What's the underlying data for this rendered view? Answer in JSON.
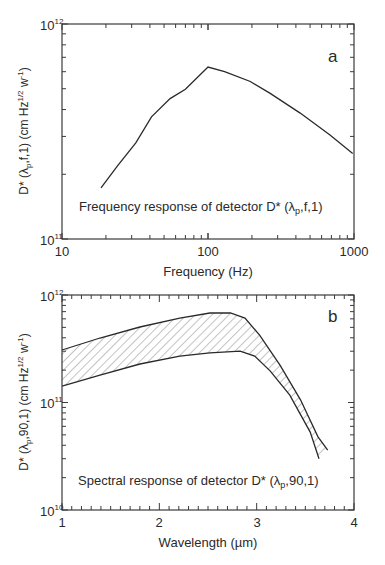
{
  "chart_data": [
    {
      "id": "a",
      "type": "line",
      "panel_label": "a",
      "title": "",
      "annotation": "Frequency response of detector D* (λp,f,1)",
      "annotation_main": "Frequency response of detector D* (λ",
      "annotation_sub": "p",
      "annotation_tail": ",f,1)",
      "xlabel": "Frequency (Hz)",
      "ylabel_main": "D* (λ",
      "ylabel_sub": "p",
      "ylabel_mid": ",f,1) (cm Hz",
      "ylabel_sup": "1/2",
      "ylabel_w": " w",
      "ylabel_sup2": "-1",
      "ylabel_end": ")",
      "xscale": "log",
      "yscale": "log",
      "xlim": [
        10,
        1000
      ],
      "ylim": [
        100000000000.0,
        1000000000000.0
      ],
      "xticks": [
        10,
        100,
        1000
      ],
      "xtick_labels": [
        "10",
        "100",
        "1000"
      ],
      "yticks_labels": [
        {
          "base": "10",
          "exp": "11"
        },
        {
          "base": "10",
          "exp": "12"
        }
      ],
      "grid": false,
      "series": [
        {
          "name": "D*(λp,f,1)",
          "x": [
            18.5,
            24,
            32,
            41,
            55,
            70,
            100,
            130,
            195,
            265,
            428,
            685,
            980
          ],
          "y": [
            173000000000.0,
            219000000000.0,
            280000000000.0,
            370000000000.0,
            450000000000.0,
            497000000000.0,
            630000000000.0,
            600000000000.0,
            540000000000.0,
            477000000000.0,
            385000000000.0,
            305000000000.0,
            250000000000.0
          ]
        }
      ]
    },
    {
      "id": "b",
      "type": "area",
      "panel_label": "b",
      "title": "",
      "annotation": "Spectral response of detector D* (λp,90,1)",
      "annotation_main": "Spectral response of detector D* (λ",
      "annotation_sub": "p",
      "annotation_tail": ",90,1)",
      "xlabel": "Wavelength (µm)",
      "ylabel_main": "D* (λ",
      "ylabel_sub": "p",
      "ylabel_mid": ",90,1) (cm Hz",
      "ylabel_sup": "1/2",
      "ylabel_w": " w",
      "ylabel_sup2": "-1",
      "ylabel_end": ")",
      "xscale": "linear",
      "yscale": "log",
      "xlim": [
        1,
        4
      ],
      "ylim": [
        10000000000.0,
        1000000000000.0
      ],
      "xticks": [
        1,
        2,
        3,
        4
      ],
      "xtick_labels": [
        "1",
        "2",
        "3",
        "4"
      ],
      "yticks_labels": [
        {
          "base": "10",
          "exp": "10"
        },
        {
          "base": "10",
          "exp": "11"
        },
        {
          "base": "10",
          "exp": "12"
        }
      ],
      "grid": false,
      "fill": "hatched band between upper and lower bounds",
      "series": [
        {
          "name": "upper bound",
          "x": [
            1.0,
            1.39,
            1.8,
            2.21,
            2.52,
            2.73,
            2.88,
            3.03,
            3.24,
            3.45,
            3.63,
            3.73
          ],
          "y": [
            308000000000.0,
            398000000000.0,
            504000000000.0,
            610000000000.0,
            680000000000.0,
            680000000000.0,
            610000000000.0,
            424000000000.0,
            223000000000.0,
            106000000000.0,
            48000000000.0,
            36000000000.0
          ]
        },
        {
          "name": "lower bound",
          "x": [
            1.0,
            1.39,
            1.8,
            2.21,
            2.52,
            2.83,
            2.98,
            3.14,
            3.34,
            3.55,
            3.64
          ],
          "y": [
            142000000000.0,
            180000000000.0,
            228000000000.0,
            270000000000.0,
            290000000000.0,
            300000000000.0,
            270000000000.0,
            196000000000.0,
            117000000000.0,
            53000000000.0,
            30000000000.0
          ]
        }
      ]
    }
  ],
  "colors": {
    "line": "#2a2a2a",
    "axis": "#3a3a3a",
    "hatch": "#6a6a6a",
    "background": "#ffffff"
  }
}
